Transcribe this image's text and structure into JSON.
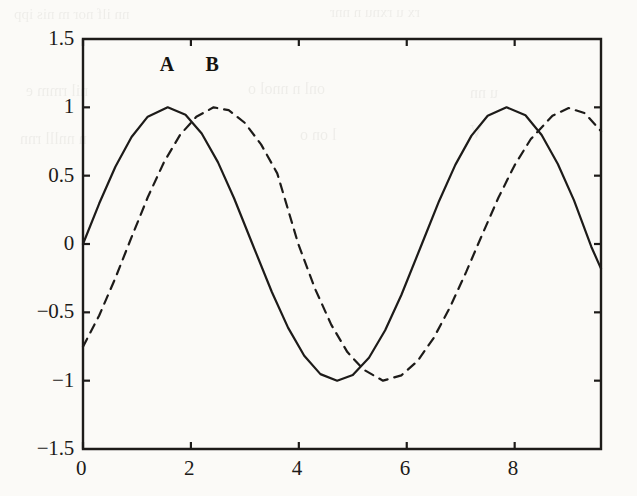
{
  "figure": {
    "background_color": "#fbfaf7",
    "ink_color": "#1d1b19",
    "ghost_text": [
      {
        "text": "nn ilf nor m nis ipp",
        "x": 14,
        "y": 6,
        "size": 15
      },
      {
        "text": "rx u rxnu n nnr",
        "x": 330,
        "y": 4,
        "size": 15
      },
      {
        "text": "nil rmm e",
        "x": 26,
        "y": 82,
        "size": 16
      },
      {
        "text": "onl n nnol  o",
        "x": 248,
        "y": 80,
        "size": 16
      },
      {
        "text": "u nn",
        "x": 470,
        "y": 84,
        "size": 16
      },
      {
        "text": "n nnlll  rnn",
        "x": 20,
        "y": 130,
        "size": 16
      },
      {
        "text": "l on o",
        "x": 300,
        "y": 126,
        "size": 16
      },
      {
        "text": "V",
        "x": 470,
        "y": 122,
        "size": 18
      }
    ]
  },
  "chart_data": {
    "type": "line",
    "title": "",
    "xlabel": "",
    "ylabel": "",
    "xlim": [
      0,
      9.6
    ],
    "ylim": [
      -1.5,
      1.5
    ],
    "xticks": [
      0,
      2,
      4,
      6,
      8
    ],
    "xticklabels": [
      "0",
      "2",
      "4",
      "6",
      "8"
    ],
    "yticks": [
      1.5,
      1,
      0.5,
      0,
      -0.5,
      -1,
      -1.5
    ],
    "yticklabels": [
      "1.5",
      "1",
      "0.5",
      "0",
      "−0.5",
      "−1",
      "−1.5"
    ],
    "grid": false,
    "legend": "none",
    "series": [
      {
        "name": "A",
        "style": "solid",
        "color": "#1d1b19",
        "linewidth": 2.2,
        "function": "sin(x)",
        "phase": 0.0,
        "amplitude": 1.0,
        "annotation": {
          "label": "A",
          "x": 1.57,
          "y": 1.32
        },
        "x": [
          0,
          0.3,
          0.6,
          0.9,
          1.2,
          1.57,
          1.9,
          2.2,
          2.5,
          2.8,
          3.14,
          3.5,
          3.8,
          4.1,
          4.4,
          4.71,
          5.0,
          5.3,
          5.6,
          5.9,
          6.28,
          6.6,
          6.9,
          7.2,
          7.5,
          7.85,
          8.2,
          8.5,
          8.8,
          9.1,
          9.42,
          9.6
        ],
        "y": [
          0.0,
          0.296,
          0.565,
          0.783,
          0.932,
          1.0,
          0.946,
          0.808,
          0.599,
          0.335,
          0.0,
          -0.351,
          -0.612,
          -0.818,
          -0.952,
          -1.0,
          -0.959,
          -0.832,
          -0.631,
          -0.373,
          0.0,
          0.315,
          0.579,
          0.793,
          0.938,
          1.0,
          0.942,
          0.798,
          0.585,
          0.319,
          -0.02,
          -0.18
        ]
      },
      {
        "name": "B",
        "style": "dashed",
        "color": "#1d1b19",
        "linewidth": 2.2,
        "dash_pattern": "9,7",
        "function": "sin(x − 0.85)",
        "phase": 0.85,
        "amplitude": 1.0,
        "annotation": {
          "label": "B",
          "x": 2.42,
          "y": 1.32
        },
        "x": [
          0,
          0.3,
          0.6,
          0.9,
          1.2,
          1.5,
          1.8,
          2.1,
          2.42,
          2.7,
          3.0,
          3.3,
          3.6,
          3.99,
          4.3,
          4.6,
          4.9,
          5.2,
          5.56,
          5.9,
          6.2,
          6.5,
          6.8,
          7.1,
          7.4,
          7.7,
          8.0,
          8.3,
          8.7,
          9.0,
          9.3,
          9.6
        ],
        "y": [
          -0.751,
          -0.523,
          -0.249,
          0.05,
          0.342,
          0.598,
          0.799,
          0.931,
          1.0,
          0.979,
          0.886,
          0.729,
          0.517,
          0.0,
          -0.327,
          -0.59,
          -0.791,
          -0.919,
          -1.0,
          -0.961,
          -0.856,
          -0.687,
          -0.464,
          -0.206,
          0.07,
          0.34,
          0.577,
          0.768,
          0.939,
          0.995,
          0.957,
          0.826
        ]
      }
    ]
  },
  "axes": {
    "box": {
      "left": 83,
      "top": 39,
      "right": 601,
      "bottom": 449
    },
    "tick_length": 7,
    "line_width": 2.4
  }
}
